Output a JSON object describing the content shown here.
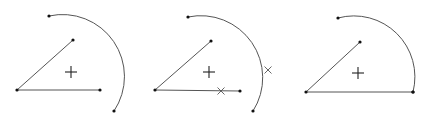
{
  "diagram": {
    "panels": [
      {
        "name": "before",
        "center_cross": [
          71,
          72
        ],
        "vertex": [
          17,
          90
        ],
        "line_top_end": [
          73,
          40
        ],
        "line_right_end": [
          100,
          90
        ],
        "arc": {
          "start": [
            49,
            16
          ],
          "end": [
            114,
            111
          ],
          "radius": 62,
          "sweep": "clockwise"
        },
        "markers": []
      },
      {
        "name": "intersection",
        "center_cross": [
          209,
          72
        ],
        "vertex": [
          155,
          90
        ],
        "line_top_end": [
          211,
          41
        ],
        "line_right_end": [
          240,
          91
        ],
        "arc": {
          "start": [
            188,
            17
          ],
          "end": [
            253,
            111
          ],
          "radius": 62,
          "sweep": "clockwise"
        },
        "markers": [
          [
            221,
            91
          ],
          [
            268,
            70
          ]
        ]
      },
      {
        "name": "after",
        "center_cross": [
          358,
          73
        ],
        "vertex": [
          306,
          92
        ],
        "line_top_end": [
          360,
          42
        ],
        "line_right_end": [
          413,
          92
        ],
        "arc": {
          "start": [
            338,
            18
          ],
          "end": [
            413,
            92
          ],
          "radius": 61,
          "sweep": "clockwise"
        },
        "markers": []
      }
    ]
  }
}
